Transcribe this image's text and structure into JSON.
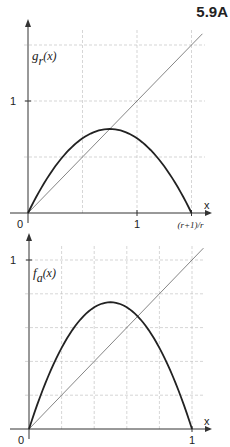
{
  "figure_label": "5.9A",
  "chart_data": [
    {
      "type": "line",
      "title": "",
      "ylabel": "g_r(x)",
      "ylabel_main": "g",
      "ylabel_sub": "r",
      "ylabel_arg": "(x)",
      "xlabel": "x",
      "r": 2,
      "xlim": [
        0,
        1.5
      ],
      "ylim": [
        0,
        1.5
      ],
      "x_ticks": [
        {
          "value": 0,
          "label": "0"
        },
        {
          "value": 1,
          "label": "1"
        },
        {
          "value": 1.5,
          "label": "(r+1)/r"
        }
      ],
      "y_ticks": [
        {
          "value": 1,
          "label": "1"
        }
      ],
      "grid_x": [
        0.5,
        1,
        1.5
      ],
      "grid_y": [
        0.5,
        1,
        1.5
      ],
      "grid": true,
      "series": [
        {
          "name": "g_r(x) = r x (1 - r x/(r+1))",
          "x": [
            0,
            0.25,
            0.5,
            0.75,
            1,
            1.25,
            1.5
          ],
          "y": [
            0,
            0.625,
            1.0,
            1.125,
            1.0,
            0.625,
            0
          ]
        },
        {
          "name": "y = x",
          "x": [
            0,
            1.6
          ],
          "y": [
            0,
            1.6
          ]
        }
      ]
    },
    {
      "type": "line",
      "title": "",
      "ylabel": "f_a(x)",
      "ylabel_main": "f",
      "ylabel_sub": "a",
      "ylabel_arg": "(x)",
      "xlabel": "x",
      "a": 3,
      "xlim": [
        0,
        1
      ],
      "ylim": [
        0,
        1
      ],
      "x_ticks": [
        {
          "value": 0,
          "label": "0"
        },
        {
          "value": 1,
          "label": "1"
        }
      ],
      "y_ticks": [
        {
          "value": 1,
          "label": "1"
        }
      ],
      "grid_x": [
        0.2,
        0.4,
        0.6,
        0.8,
        1
      ],
      "grid_y": [
        0.2,
        0.4,
        0.6,
        0.8,
        1
      ],
      "grid": true,
      "series": [
        {
          "name": "f_a(x) = a x (1 - x)",
          "x": [
            0,
            0.25,
            0.5,
            0.75,
            1
          ],
          "y": [
            0,
            0.5625,
            0.75,
            0.5625,
            0
          ]
        },
        {
          "name": "y = x",
          "x": [
            0,
            1.07
          ],
          "y": [
            0,
            1.07
          ]
        }
      ]
    }
  ]
}
